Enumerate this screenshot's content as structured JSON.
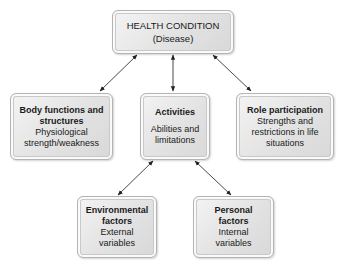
{
  "diagram": {
    "nodes": {
      "health_condition": {
        "title": "HEALTH CONDITION",
        "subtitle": "(Disease)"
      },
      "body_functions": {
        "title_line1": "Body functions and",
        "title_line2": "structures",
        "desc_line1": "Physiological",
        "desc_line2": "strength/weakness"
      },
      "activities": {
        "title": "Activities",
        "desc_line1": "Abilities and",
        "desc_line2": "limitations"
      },
      "role_participation": {
        "title": "Role participation",
        "desc_line1": "Strengths and",
        "desc_line2": "restrictions in life",
        "desc_line3": "situations"
      },
      "environmental_factors": {
        "title_line1": "Environmental",
        "title_line2": "factors",
        "desc_line1": "External",
        "desc_line2": "variables"
      },
      "personal_factors": {
        "title_line1": "Personal",
        "title_line2": "factors",
        "desc_line1": "Internal",
        "desc_line2": "variables"
      }
    },
    "edges": [
      {
        "from": "health_condition",
        "to": "body_functions",
        "type": "bidirectional"
      },
      {
        "from": "health_condition",
        "to": "activities",
        "type": "bidirectional"
      },
      {
        "from": "health_condition",
        "to": "role_participation",
        "type": "bidirectional"
      },
      {
        "from": "activities",
        "to": "environmental_factors",
        "type": "bidirectional"
      },
      {
        "from": "activities",
        "to": "personal_factors",
        "type": "bidirectional"
      }
    ]
  }
}
